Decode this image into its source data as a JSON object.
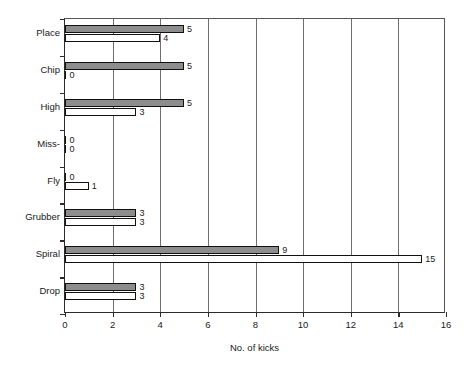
{
  "chart_data": {
    "type": "bar",
    "orientation": "horizontal",
    "title": "",
    "xlabel": "No. of kicks",
    "ylabel": "",
    "xlim": [
      0,
      16
    ],
    "xticks": [
      0,
      2,
      4,
      6,
      8,
      10,
      12,
      14,
      16
    ],
    "xtick_labels": [
      "0",
      "2",
      "4",
      "6",
      "8",
      "10",
      "12",
      "14",
      "16"
    ],
    "grid": "vertical",
    "legend": "none",
    "categories": [
      "Place",
      "Chip",
      "High",
      "Miss-",
      "Fly",
      "Grubber",
      "Spiral",
      "Drop"
    ],
    "series": [
      {
        "name": "series-1",
        "color": "#8d8d8d",
        "values": [
          5,
          5,
          5,
          0,
          0,
          3,
          9,
          3
        ],
        "labels": [
          "5",
          "5",
          "5",
          "0",
          "0",
          "3",
          "9",
          "3"
        ]
      },
      {
        "name": "series-2",
        "color": "#ffffff",
        "values": [
          4,
          0,
          3,
          0,
          1,
          3,
          15,
          3
        ],
        "labels": [
          "4",
          "0",
          "3",
          "0",
          "1",
          "3",
          "15",
          "3"
        ]
      }
    ]
  },
  "colors": {
    "series_1_fill": "#8d8d8d",
    "series_2_fill": "#ffffff",
    "bar_outline": "#111111",
    "axis": "#2b2b2b",
    "gridline": "#6f6f6f",
    "background": "#ffffff",
    "text": "#1a1a1a"
  }
}
